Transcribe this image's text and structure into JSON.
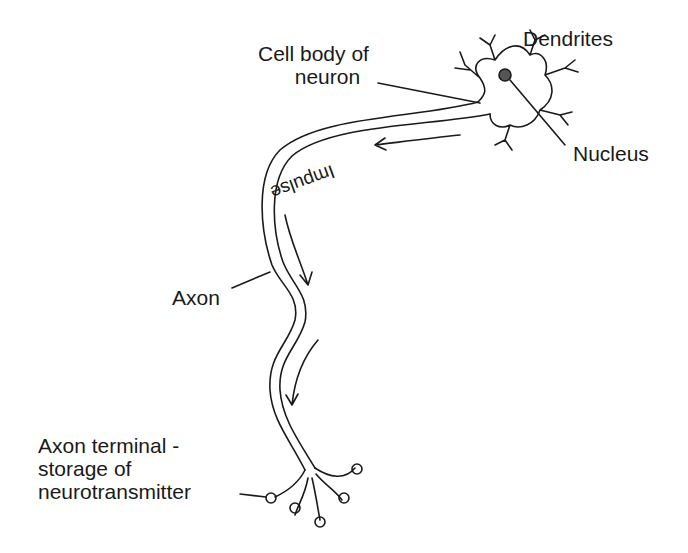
{
  "diagram": {
    "labels": {
      "cell_body_line1": "Cell body of",
      "cell_body_line2": "neuron",
      "dendrites": "Dendrites",
      "nucleus": "Nucleus",
      "impulse": "Impulse",
      "axon": "Axon",
      "terminal_line1": "Axon terminal -",
      "terminal_line2": "storage of",
      "terminal_line3": "neurotransmitter"
    },
    "colors": {
      "stroke": "#1a1a1a",
      "background": "#ffffff"
    }
  }
}
